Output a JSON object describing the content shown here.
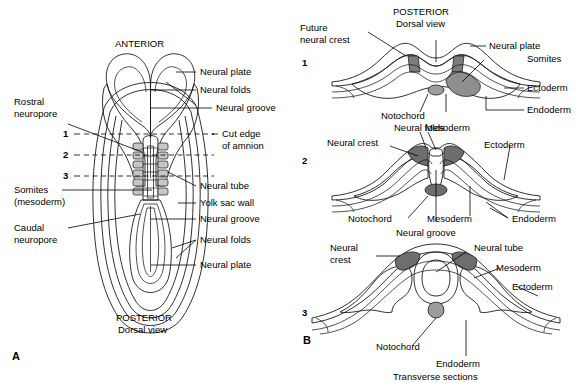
{
  "figure": {
    "caption_bottom": "Transverse sections"
  },
  "panelA": {
    "key": "A",
    "top_label": "ANTERIOR",
    "bottom_label_1": "POSTERIOR",
    "bottom_label_2": "Dorsal view",
    "section_numbers": [
      "1",
      "2",
      "3"
    ],
    "labels_left": [
      {
        "id": "rostral-neuropore",
        "line1": "Rostral",
        "line2": "neuropore"
      },
      {
        "id": "somites-mesoderm",
        "line1": "Somites",
        "line2": "(mesoderm)"
      },
      {
        "id": "caudal-neuropore",
        "line1": "Caudal",
        "line2": "neuropore"
      }
    ],
    "labels_right": [
      {
        "id": "neural-plate-top",
        "text": "Neural plate"
      },
      {
        "id": "neural-folds-top",
        "text": "Neural folds"
      },
      {
        "id": "neural-groove-top",
        "text": "Neural groove"
      },
      {
        "id": "cut-edge-amnion",
        "line1": "Cut edge",
        "line2": "of amnion"
      },
      {
        "id": "neural-tube",
        "text": "Neural tube"
      },
      {
        "id": "yolk-sac-wall",
        "text": "Yolk sac wall"
      },
      {
        "id": "neural-groove-bottom",
        "text": "Neural groove"
      },
      {
        "id": "neural-folds-bottom",
        "text": "Neural folds"
      },
      {
        "id": "neural-plate-bottom",
        "text": "Neural plate"
      }
    ]
  },
  "panelB": {
    "key": "B",
    "sections": [
      {
        "number": "1",
        "header_line1": "POSTERIOR",
        "header_line2": "Dorsal view",
        "labels": [
          {
            "id": "future-neural-crest",
            "line1": "Future",
            "line2": "neural crest"
          },
          {
            "id": "neural-plate",
            "text": "Neural plate"
          },
          {
            "id": "somites",
            "text": "Somites"
          },
          {
            "id": "ectoderm",
            "text": "Ectoderm"
          },
          {
            "id": "endoderm",
            "text": "Endoderm"
          },
          {
            "id": "notochord",
            "text": "Notochord"
          },
          {
            "id": "mesoderm",
            "text": "Mesoderm"
          }
        ]
      },
      {
        "number": "2",
        "labels": [
          {
            "id": "neural-folds",
            "text": "Neural folds"
          },
          {
            "id": "neural-crest",
            "text": "Neural crest"
          },
          {
            "id": "ectoderm",
            "text": "Ectoderm"
          },
          {
            "id": "notochord",
            "text": "Notochord"
          },
          {
            "id": "mesoderm",
            "text": "Mesoderm"
          },
          {
            "id": "endoderm",
            "text": "Endoderm"
          },
          {
            "id": "neural-groove",
            "text": "Neural groove"
          }
        ]
      },
      {
        "number": "3",
        "labels": [
          {
            "id": "neural-crest",
            "line1": "Neural",
            "line2": "crest"
          },
          {
            "id": "neural-tube",
            "text": "Neural tube"
          },
          {
            "id": "mesoderm",
            "text": "Mesoderm"
          },
          {
            "id": "ectoderm",
            "text": "Ectoderm"
          },
          {
            "id": "notochord",
            "text": "Notochord"
          },
          {
            "id": "endoderm",
            "text": "Endoderm"
          }
        ]
      }
    ]
  },
  "colors": {
    "background": "#ffffff",
    "stroke": "#1a1a1a",
    "tissue_light": "#e2e2e2",
    "tissue_mid": "#c2c2c2",
    "tissue_dark": "#9a9a9a",
    "tissue_darker": "#7d7d7d",
    "neural_crest": "#6e6e6e"
  }
}
